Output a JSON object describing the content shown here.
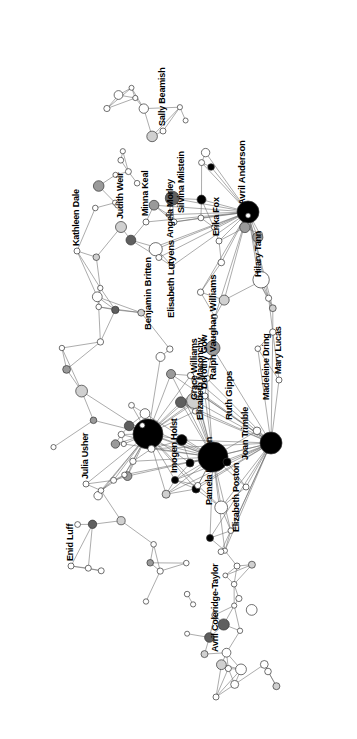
{
  "chart_data": {
    "type": "scatter",
    "title": "",
    "subtitle": "",
    "xlabel": "",
    "ylabel": "",
    "grid": false,
    "legend": "none",
    "label_rotation_deg": -90,
    "palette": {
      "node_white": "#ffffff",
      "node_light": "#d0d0d0",
      "node_mid": "#9a9a9a",
      "node_dark": "#5f5f5f",
      "node_black": "#000000",
      "edge": "#666666",
      "stroke": "#333333",
      "background": "#ffffff",
      "label": "#000000"
    },
    "axis_ranges": {
      "x": [
        0,
        357
      ],
      "y": [
        0,
        739
      ]
    },
    "labeled_nodes": [
      {
        "id": "kathleen-dale",
        "label": "Kathleen Dale",
        "x": 77,
        "y": 251,
        "r": 3.0,
        "fill": "#ffffff",
        "lx": 72,
        "ly": 246,
        "fs": 9.0
      },
      {
        "id": "judith-weir",
        "label": "Judith Weir",
        "x": 121,
        "y": 227,
        "r": 5.5,
        "fill": "#d0d0d0",
        "lx": 116,
        "ly": 219,
        "fs": 9.0
      },
      {
        "id": "minna-keal",
        "label": "Minna Keal",
        "x": 146,
        "y": 222,
        "r": 3.0,
        "fill": "#ffffff",
        "lx": 141,
        "ly": 216,
        "fs": 9.0
      },
      {
        "id": "sally-beamish",
        "label": "Sally Beamish",
        "x": 163,
        "y": 131,
        "r": 3.0,
        "fill": "#ffffff",
        "lx": 158,
        "ly": 126,
        "fs": 9.0
      },
      {
        "id": "angela-morley",
        "label": "Angela Morley",
        "x": 155,
        "y": 247,
        "r": 3.0,
        "fill": "#ffffff",
        "lx": 166,
        "ly": 238,
        "fs": 9.0
      },
      {
        "id": "silvina-milstein",
        "label": "Silvina Milstein",
        "x": 174,
        "y": 222,
        "r": 3.0,
        "fill": "#ffffff",
        "lx": 177,
        "ly": 213,
        "fs": 9.0
      },
      {
        "id": "avril-anderson",
        "label": "Avril Anderson",
        "x": 248,
        "y": 212,
        "r": 11.0,
        "fill": "#000000",
        "lx": 237,
        "ly": 205,
        "fs": 9.5
      },
      {
        "id": "erika-fox",
        "label": "Erika Fox",
        "x": 219,
        "y": 241,
        "r": 3.0,
        "fill": "#ffffff",
        "lx": 212,
        "ly": 236,
        "fs": 9.0
      },
      {
        "id": "hilary-tann",
        "label": "Hilary Tann",
        "x": 259,
        "y": 282,
        "r": 3.0,
        "fill": "#ffffff",
        "lx": 254,
        "ly": 277,
        "fs": 9.0
      },
      {
        "id": "elisabeth-lutyens",
        "label": "Elisabeth Lutyens",
        "x": 171,
        "y": 374,
        "r": 4.5,
        "fill": "#9a9a9a",
        "lx": 166,
        "ly": 318,
        "fs": 9.5
      },
      {
        "id": "benjamin-britten",
        "label": "Benjamin Britten",
        "x": 148,
        "y": 434,
        "r": 15.0,
        "fill": "#000000",
        "lx": 143,
        "ly": 330,
        "fs": 9.5
      },
      {
        "id": "grace-williams",
        "label": "Grace Williams",
        "x": 190,
        "y": 463,
        "r": 4.0,
        "fill": "#000000",
        "lx": 190,
        "ly": 400,
        "fs": 9.0
      },
      {
        "id": "dorothy-gow",
        "label": "Dorothy Gow",
        "x": 205,
        "y": 396,
        "r": 3.0,
        "fill": "#ffffff",
        "lx": 200,
        "ly": 389,
        "fs": 9.0
      },
      {
        "id": "elizabeth-maconchy",
        "label": "Elizabeth Maconchy",
        "x": 196,
        "y": 489,
        "r": 4.0,
        "fill": "#000000",
        "lx": 196,
        "ly": 420,
        "fs": 9.0
      },
      {
        "id": "ralph-vaughan-williams",
        "label": "Ralph Vaughan Williams",
        "x": 213,
        "y": 457,
        "r": 15.0,
        "fill": "#000000",
        "lx": 208,
        "ly": 380,
        "fs": 9.5
      },
      {
        "id": "imogen-holst",
        "label": "Imogen Holst",
        "x": 175,
        "y": 480,
        "r": 3.5,
        "fill": "#000000",
        "lx": 170,
        "ly": 473,
        "fs": 9.0
      },
      {
        "id": "ruth-gipps",
        "label": "Ruth Gipps",
        "x": 227,
        "y": 462,
        "r": 4.0,
        "fill": "#000000",
        "lx": 224,
        "ly": 420,
        "fs": 9.5
      },
      {
        "id": "pamela-harrison",
        "label": "Pamela Harrison",
        "x": 210,
        "y": 538,
        "r": 3.5,
        "fill": "#000000",
        "lx": 205,
        "ly": 505,
        "fs": 9.0
      },
      {
        "id": "joan-trimble",
        "label": "Joan Trimble",
        "x": 246,
        "y": 487,
        "r": 3.0,
        "fill": "#ffffff",
        "lx": 241,
        "ly": 460,
        "fs": 9.0
      },
      {
        "id": "madeleine-dring",
        "label": "Madeleine Dring",
        "x": 271,
        "y": 443,
        "r": 11.0,
        "fill": "#000000",
        "lx": 262,
        "ly": 400,
        "fs": 9.0
      },
      {
        "id": "mary-lucas",
        "label": "Mary Lucas",
        "x": 279,
        "y": 380,
        "r": 3.0,
        "fill": "#ffffff",
        "lx": 274,
        "ly": 374,
        "fs": 9.0
      },
      {
        "id": "elizabeth-poston",
        "label": "Elizabeth Poston",
        "x": 237,
        "y": 566,
        "r": 3.0,
        "fill": "#ffffff",
        "lx": 232,
        "ly": 532,
        "fs": 9.0
      },
      {
        "id": "julia-usher",
        "label": "Julia Usher",
        "x": 86,
        "y": 484,
        "r": 3.0,
        "fill": "#ffffff",
        "lx": 81,
        "ly": 479,
        "fs": 9.0
      },
      {
        "id": "enid-luff",
        "label": "Enid Luff",
        "x": 71,
        "y": 566,
        "r": 3.0,
        "fill": "#ffffff",
        "lx": 66,
        "ly": 561,
        "fs": 9.0
      },
      {
        "id": "avril-coleridge-taylor",
        "label": "Avril Coleridge-Taylor",
        "x": 216,
        "y": 697,
        "r": 3.0,
        "fill": "#ffffff",
        "lx": 211,
        "ly": 652,
        "fs": 9.0
      }
    ],
    "unlabeled_node_count": 118,
    "edge_count": 268
  },
  "figure": {
    "caption": "",
    "footer": ""
  }
}
